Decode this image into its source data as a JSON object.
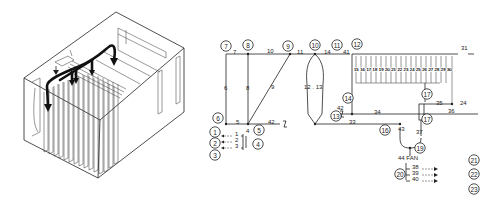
{
  "figure": {
    "left_panel": {
      "description": "isometric enclosure with stacked fin plates and airflow arrows",
      "plate_count": 15,
      "airflow_arrows": 4
    },
    "node_circles": [
      {
        "id": "7",
        "x": 226,
        "y": 46
      },
      {
        "id": "8",
        "x": 248,
        "y": 45
      },
      {
        "id": "9",
        "x": 288,
        "y": 46
      },
      {
        "id": "10",
        "x": 315,
        "y": 45
      },
      {
        "id": "11",
        "x": 337,
        "y": 45
      },
      {
        "id": "12",
        "x": 357,
        "y": 44
      },
      {
        "id": "6",
        "x": 218,
        "y": 118
      },
      {
        "id": "5",
        "x": 259,
        "y": 130
      },
      {
        "id": "1",
        "x": 215,
        "y": 132
      },
      {
        "id": "2",
        "x": 215,
        "y": 143
      },
      {
        "id": "3",
        "x": 215,
        "y": 155
      },
      {
        "id": "4",
        "x": 258,
        "y": 144
      },
      {
        "id": "13",
        "x": 336,
        "y": 116
      },
      {
        "id": "14",
        "x": 348,
        "y": 98
      },
      {
        "id": "16",
        "x": 385,
        "y": 130
      },
      {
        "id": "17",
        "x": 427,
        "y": 94
      },
      {
        "id": "17",
        "x": 427,
        "y": 119
      },
      {
        "id": "19",
        "x": 420,
        "y": 148
      },
      {
        "id": "21",
        "x": 474,
        "y": 160
      },
      {
        "id": "20",
        "x": 400,
        "y": 174
      },
      {
        "id": "22",
        "x": 474,
        "y": 174
      },
      {
        "id": "23",
        "x": 474,
        "y": 189
      }
    ],
    "edge_labels": [
      {
        "text": "7",
        "x": 233,
        "y": 54
      },
      {
        "text": "10",
        "x": 267,
        "y": 53
      },
      {
        "text": "11",
        "x": 297,
        "y": 54
      },
      {
        "text": "14",
        "x": 324,
        "y": 54
      },
      {
        "text": "41",
        "x": 343,
        "y": 54
      },
      {
        "text": "31",
        "x": 461,
        "y": 50
      },
      {
        "text": "6",
        "x": 224,
        "y": 90
      },
      {
        "text": "8",
        "x": 246,
        "y": 90
      },
      {
        "text": "9",
        "x": 271,
        "y": 89
      },
      {
        "text": "12 . 13",
        "x": 304,
        "y": 89
      },
      {
        "text": "5",
        "x": 236,
        "y": 124
      },
      {
        "text": "42",
        "x": 268,
        "y": 124
      },
      {
        "text": "4",
        "x": 246,
        "y": 133
      },
      {
        "text": "1",
        "x": 235,
        "y": 136
      },
      {
        "text": "2",
        "x": 235,
        "y": 142
      },
      {
        "text": "3",
        "x": 235,
        "y": 148
      },
      {
        "text": "42",
        "x": 337,
        "y": 110
      },
      {
        "text": "34",
        "x": 374,
        "y": 114
      },
      {
        "text": "33",
        "x": 349,
        "y": 124
      },
      {
        "text": "35",
        "x": 436,
        "y": 105
      },
      {
        "text": "24",
        "x": 460,
        "y": 105
      },
      {
        "text": "36",
        "x": 448,
        "y": 113
      },
      {
        "text": "43",
        "x": 398,
        "y": 131
      },
      {
        "text": "37",
        "x": 416,
        "y": 134
      },
      {
        "text": "44 FAN",
        "x": 398,
        "y": 160
      },
      {
        "text": "38",
        "x": 412,
        "y": 169
      },
      {
        "text": "39",
        "x": 412,
        "y": 175
      },
      {
        "text": "40",
        "x": 412,
        "y": 181
      }
    ],
    "bus_channel_labels": [
      "15",
      "16",
      "17",
      "18",
      "19",
      "20",
      "21",
      "22",
      "23",
      "24",
      "25",
      "26",
      "27",
      "28",
      "29",
      "30"
    ]
  }
}
